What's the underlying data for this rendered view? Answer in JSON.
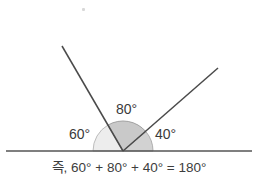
{
  "figure": {
    "baseline": {
      "y": 151,
      "x_start": 6,
      "x_end": 252,
      "color": "#555555"
    },
    "vertex": {
      "x": 123,
      "y": 151
    },
    "arc_radius": 30,
    "colors": {
      "line": "#555555",
      "ray": "#4a4a4a",
      "sector_light": "#ededed",
      "sector_dark": "#c9c9c9",
      "sector_stroke": "#9a9a9a",
      "text": "#3a3a3a"
    },
    "rays": [
      {
        "name": "left-ray",
        "angle_deg": 120,
        "end_x": 62,
        "end_y": 46
      },
      {
        "name": "right-ray",
        "angle_deg": 40,
        "end_x": 218,
        "end_y": 68
      }
    ],
    "sectors": [
      {
        "name": "sector-60",
        "label": "60°",
        "value": 60,
        "start_deg": 180,
        "end_deg": 120,
        "fill": "light"
      },
      {
        "name": "sector-80",
        "label": "80°",
        "value": 80,
        "start_deg": 120,
        "end_deg": 40,
        "fill": "dark"
      },
      {
        "name": "sector-40",
        "label": "40°",
        "value": 40,
        "start_deg": 40,
        "end_deg": 0,
        "fill": "light"
      }
    ],
    "labels": {
      "angle_80": "80°",
      "angle_60": "60°",
      "angle_40": "40°"
    },
    "caption": "즉, 60° + 80° + 40° = 180°"
  }
}
